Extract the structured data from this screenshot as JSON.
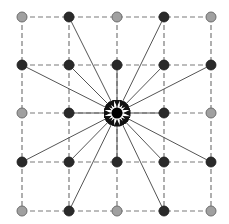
{
  "diagram": {
    "type": "grid-neighborhood",
    "grid": {
      "cols": 5,
      "rows": 5,
      "x": [
        22,
        69,
        117,
        164,
        211
      ],
      "y": [
        17,
        65,
        113,
        162,
        211
      ],
      "line_style": "dashed",
      "line_color": "#7a7a7a"
    },
    "colors": {
      "dark_node": "#2a2a2a",
      "gray_node": "#a0a0a0",
      "center_node": "#000000",
      "edge": "#555555"
    },
    "center": {
      "col": 2,
      "row": 2
    },
    "nodes": [
      {
        "col": 0,
        "row": 0,
        "kind": "gray"
      },
      {
        "col": 1,
        "row": 0,
        "kind": "dark"
      },
      {
        "col": 2,
        "row": 0,
        "kind": "gray"
      },
      {
        "col": 3,
        "row": 0,
        "kind": "dark"
      },
      {
        "col": 4,
        "row": 0,
        "kind": "gray"
      },
      {
        "col": 0,
        "row": 1,
        "kind": "dark"
      },
      {
        "col": 1,
        "row": 1,
        "kind": "dark"
      },
      {
        "col": 2,
        "row": 1,
        "kind": "dark"
      },
      {
        "col": 3,
        "row": 1,
        "kind": "dark"
      },
      {
        "col": 4,
        "row": 1,
        "kind": "dark"
      },
      {
        "col": 0,
        "row": 2,
        "kind": "gray"
      },
      {
        "col": 1,
        "row": 2,
        "kind": "dark"
      },
      {
        "col": 2,
        "row": 2,
        "kind": "center"
      },
      {
        "col": 3,
        "row": 2,
        "kind": "dark"
      },
      {
        "col": 4,
        "row": 2,
        "kind": "gray"
      },
      {
        "col": 0,
        "row": 3,
        "kind": "dark"
      },
      {
        "col": 1,
        "row": 3,
        "kind": "dark"
      },
      {
        "col": 2,
        "row": 3,
        "kind": "dark"
      },
      {
        "col": 3,
        "row": 3,
        "kind": "dark"
      },
      {
        "col": 4,
        "row": 3,
        "kind": "dark"
      },
      {
        "col": 0,
        "row": 4,
        "kind": "gray"
      },
      {
        "col": 1,
        "row": 4,
        "kind": "dark"
      },
      {
        "col": 2,
        "row": 4,
        "kind": "gray"
      },
      {
        "col": 3,
        "row": 4,
        "kind": "dark"
      },
      {
        "col": 4,
        "row": 4,
        "kind": "gray"
      }
    ],
    "arrows_to_center_from": [
      [
        1,
        0
      ],
      [
        3,
        0
      ],
      [
        0,
        1
      ],
      [
        1,
        1
      ],
      [
        2,
        1
      ],
      [
        3,
        1
      ],
      [
        4,
        1
      ],
      [
        1,
        2
      ],
      [
        3,
        2
      ],
      [
        0,
        3
      ],
      [
        1,
        3
      ],
      [
        2,
        3
      ],
      [
        3,
        3
      ],
      [
        4,
        3
      ],
      [
        1,
        4
      ],
      [
        3,
        4
      ]
    ]
  }
}
